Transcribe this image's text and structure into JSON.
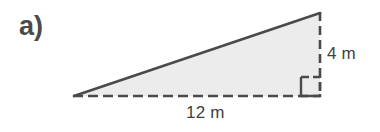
{
  "figure": {
    "part_label": "a)",
    "shape": "right-triangle",
    "fill_color": "#ececec",
    "stroke_color": "#4a4a4a",
    "text_color": "#3f3f3f",
    "background_color": "#ffffff",
    "vertices": {
      "left": [
        74,
        96
      ],
      "apex": [
        320,
        13
      ],
      "right_angle": [
        320,
        96
      ]
    },
    "hypotenuse": {
      "style": "solid",
      "width_px": 2.6
    },
    "base": {
      "label": "12 m",
      "value": 12,
      "unit": "m",
      "style": "dashed",
      "from": [
        74,
        96
      ],
      "to": [
        320,
        96
      ]
    },
    "height": {
      "label": "4 m",
      "value": 4,
      "unit": "m",
      "style": "dashed",
      "from": [
        320,
        13
      ],
      "to": [
        320,
        96
      ]
    },
    "right_angle_marker": {
      "name": "right-angle-square",
      "size_px": 19,
      "style": "dashed-and-solid",
      "corner": [
        320,
        96
      ]
    }
  }
}
